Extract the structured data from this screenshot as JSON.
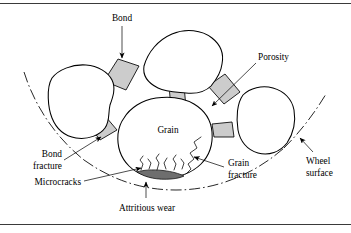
{
  "figure": {
    "title_text": "",
    "colors": {
      "grain_fill": "#ffffff",
      "bond_fill": "#cccccc",
      "wear_flat_fill": "#6e6e6e",
      "outline": "#000000",
      "rule": "#3a3a3a"
    },
    "labels": {
      "bond": "Bond",
      "porosity": "Porosity",
      "grain": "Grain",
      "wheel_surface_line1": "Wheel",
      "wheel_surface_line2": "surface",
      "bond_fracture_line1": "Bond",
      "bond_fracture_line2": "fracture",
      "grain_fracture_line1": "Grain",
      "grain_fracture_line2": "fracture",
      "microcracks": "Microcracks",
      "attritious_wear": "Attritious wear"
    },
    "icons": {
      "arrow_bond": "arrow-down-icon",
      "arrow_porosity": "arrow-down-left-icon",
      "arrow_wheel_surface": "arrow-up-left-icon",
      "arrow_bond_fracture": "arrow-up-right-icon",
      "arrow_grain_fracture": "arrow-up-left-icon",
      "arrow_attritious_wear": "arrow-up-icon"
    }
  }
}
